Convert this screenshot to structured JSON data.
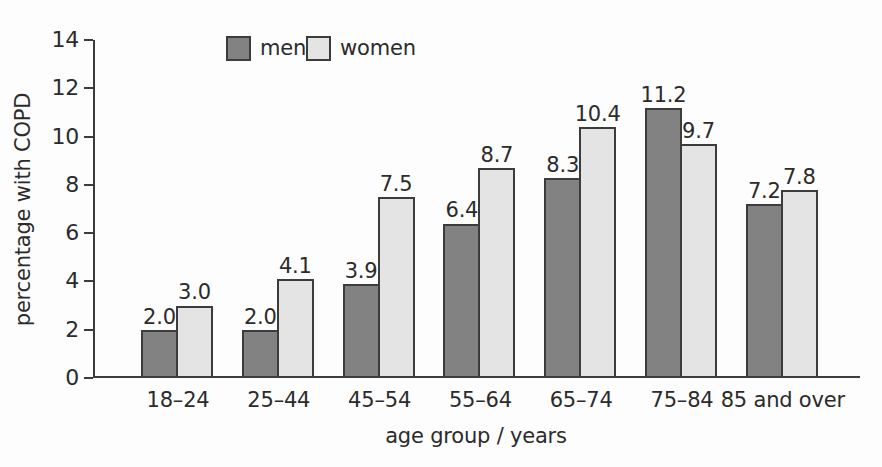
{
  "chart_data": {
    "type": "bar",
    "title": "",
    "categories": [
      "18–24",
      "25–44",
      "45–54",
      "55–64",
      "65–74",
      "75–84",
      "85 and over"
    ],
    "series": [
      {
        "name": "men",
        "color": "#828282",
        "values": [
          2.0,
          2.0,
          3.9,
          6.4,
          8.3,
          11.2,
          7.2
        ]
      },
      {
        "name": "women",
        "color": "#e4e4e4",
        "values": [
          3.0,
          4.1,
          7.5,
          8.7,
          10.4,
          9.7,
          7.8
        ]
      }
    ],
    "xlabel": "age group / years",
    "ylabel": "percentage with COPD",
    "ylim": [
      0,
      14
    ],
    "yticks": [
      0,
      2,
      4,
      6,
      8,
      10,
      12,
      14
    ],
    "grid": false,
    "legend_position": "top-inside",
    "bar_value_labels_shown": true,
    "bar_border_color": "#3c3c3c",
    "axis_color": "#3c3c3c",
    "text_color": "#2b2b2b",
    "background_color": "#fdfdfd"
  }
}
